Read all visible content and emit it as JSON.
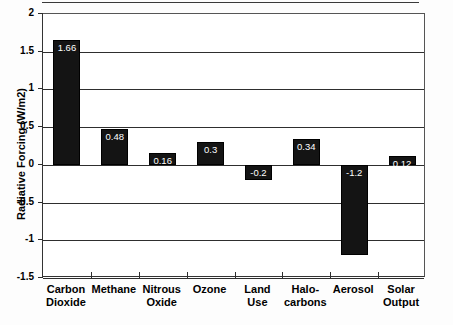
{
  "chart_data": {
    "type": "bar",
    "title": "",
    "subtitle": "",
    "xlabel": "",
    "ylabel": "Radiative Forcing (W/m2)",
    "categories": [
      "Carbon Dioxide",
      "Methane",
      "Nitrous Oxide",
      "Ozone",
      "Land Use",
      "Halocarbons",
      "Aerosol",
      "Solar Output"
    ],
    "category_lines": [
      [
        "Carbon",
        "Dioxide"
      ],
      [
        "Methane"
      ],
      [
        "Nitrous",
        "Oxide"
      ],
      [
        "Ozone"
      ],
      [
        "Land",
        "Use"
      ],
      [
        "Halo-",
        "carbons"
      ],
      [
        "Aerosol"
      ],
      [
        "Solar",
        "Output"
      ]
    ],
    "values": [
      1.66,
      0.48,
      0.16,
      0.3,
      -0.2,
      0.34,
      -1.2,
      0.12
    ],
    "data_labels": [
      "1.66",
      "0.48",
      "0.16",
      "0.3",
      "-0.2",
      "0.34",
      "-1.2",
      "0.12"
    ],
    "ylim": [
      -1.5,
      2
    ],
    "ytick_values": [
      2,
      1.5,
      1,
      0.5,
      0,
      -0.5,
      -1,
      -1.5
    ],
    "ytick_labels": [
      "2",
      "1.5",
      "1",
      "0.5",
      "0",
      "-0.5",
      "-1",
      "-1.5"
    ],
    "grid": true,
    "legend": false,
    "legend_position": "none",
    "bar_color": "#141414",
    "label_color": "#ffffff",
    "axis_color": "#2e2e2e",
    "plot_background": "#ffffff"
  }
}
